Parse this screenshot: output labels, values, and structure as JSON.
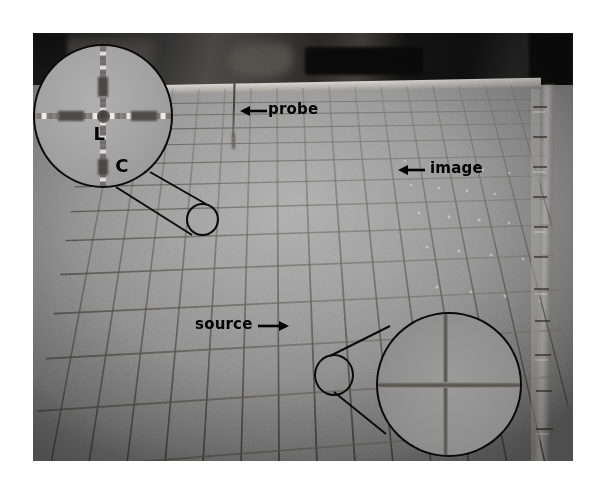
{
  "figure": {
    "type": "photograph",
    "background_color": "#ffffff",
    "photo_bounds": {
      "x": 33,
      "y": 33,
      "width": 540,
      "height": 428
    }
  },
  "annotations": [
    {
      "id": "probe",
      "label": "probe",
      "arrow": "left",
      "arrow_glyph": "←",
      "text_x": 268,
      "text_y": 100,
      "color": "#000000"
    },
    {
      "id": "image",
      "label": "image",
      "arrow": "left",
      "arrow_glyph": "←",
      "text_x": 430,
      "text_y": 159,
      "color": "#000000"
    },
    {
      "id": "source",
      "label": "source",
      "arrow": "right",
      "arrow_glyph": "→",
      "text_x": 195,
      "text_y": 315,
      "color": "#000000"
    }
  ],
  "insets": [
    {
      "id": "top-left",
      "position": "top-left",
      "shape": "circle",
      "subject": "crosshair scatterer junction",
      "labels": [
        {
          "text": "L",
          "meaning": "inductor arm"
        },
        {
          "text": "C",
          "meaning": "capacitor arm"
        }
      ],
      "origin_marker": {
        "x": 186,
        "y": 203,
        "diameter": 33
      }
    },
    {
      "id": "bottom-right",
      "position": "bottom-right",
      "shape": "circle",
      "subject": "grid wire crossing",
      "labels": [],
      "origin_marker": {
        "x": 314,
        "y": 354,
        "diameter": 40
      }
    }
  ],
  "scene": {
    "surface": "wire mesh grid plate",
    "probe_present": true,
    "ruler_present": true,
    "colors": {
      "photo_mid_gray": "#8d8d8d",
      "photo_light_gray": "#a6a6a6",
      "backdrop_dark": "#1d1d1d",
      "annotation_black": "#000000",
      "page_white": "#ffffff"
    }
  }
}
